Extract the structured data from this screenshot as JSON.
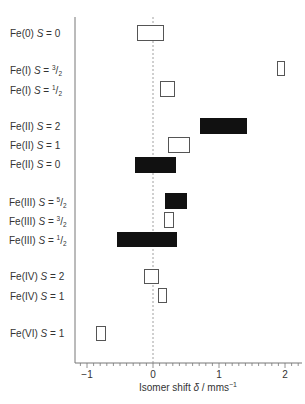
{
  "chart_data": {
    "type": "range-bar",
    "title": "",
    "xlabel": "Isomer shift δ / mms⁻¹",
    "ylabel": "",
    "xlim": [
      -1.2,
      2.25
    ],
    "xticks": [
      -1,
      0,
      1,
      2
    ],
    "grid": false,
    "reference_line": {
      "x": 0,
      "style": "dotted"
    },
    "categories": [
      {
        "label": "Fe(0) S = 0",
        "oxidation": "Fe(0)",
        "spin": "0",
        "min": -0.24,
        "max": 0.17,
        "filled": false
      },
      {
        "label": "Fe(I) S = 3/2",
        "oxidation": "Fe(I)",
        "spin": "3/2",
        "min": 1.88,
        "max": 2.0,
        "filled": false
      },
      {
        "label": "Fe(I) S = 1/2",
        "oxidation": "Fe(I)",
        "spin": "1/2",
        "min": 0.11,
        "max": 0.33,
        "filled": false
      },
      {
        "label": "Fe(II) S = 2",
        "oxidation": "Fe(II)",
        "spin": "2",
        "min": 0.71,
        "max": 1.42,
        "filled": true
      },
      {
        "label": "Fe(II) S = 1",
        "oxidation": "Fe(II)",
        "spin": "1",
        "min": 0.23,
        "max": 0.56,
        "filled": false
      },
      {
        "label": "Fe(II) S = 0",
        "oxidation": "Fe(II)",
        "spin": "0",
        "min": -0.27,
        "max": 0.35,
        "filled": true
      },
      {
        "label": "Fe(III) S = 5/2",
        "oxidation": "Fe(III)",
        "spin": "5/2",
        "min": 0.18,
        "max": 0.52,
        "filled": true
      },
      {
        "label": "Fe(III) S = 3/2",
        "oxidation": "Fe(III)",
        "spin": "3/2",
        "min": 0.17,
        "max": 0.32,
        "filled": false
      },
      {
        "label": "Fe(III) S = 1/2",
        "oxidation": "Fe(III)",
        "spin": "1/2",
        "min": -0.55,
        "max": 0.36,
        "filled": true
      },
      {
        "label": "Fe(IV) S = 2",
        "oxidation": "Fe(IV)",
        "spin": "2",
        "min": -0.14,
        "max": 0.09,
        "filled": false
      },
      {
        "label": "Fe(IV) S = 1",
        "oxidation": "Fe(IV)",
        "spin": "1",
        "min": 0.08,
        "max": 0.21,
        "filled": false
      },
      {
        "label": "Fe(VI) S = 1",
        "oxidation": "Fe(VI)",
        "spin": "1",
        "min": -0.86,
        "max": -0.71,
        "filled": false
      }
    ]
  },
  "axis": {
    "tick_labels": [
      "−1",
      "0",
      "1",
      "2"
    ],
    "xlabel_prefix": "Isomer shift ",
    "xlabel_symbol": "δ",
    "xlabel_unit": " / mms",
    "xlabel_exp": "−1"
  },
  "colors": {
    "filled": "#111111",
    "outline": "#555555",
    "axis": "#666666"
  }
}
